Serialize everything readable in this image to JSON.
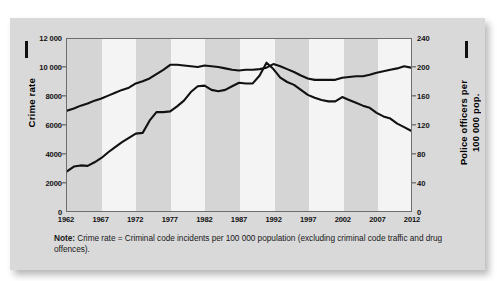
{
  "figure": {
    "note_label": "Note:",
    "note_text": "Crime rate = Criminal code incidents per 100 000 population (excluding criminal code traffic and drug offences)."
  },
  "chart_data": {
    "type": "line",
    "title": "",
    "subtitle": "",
    "xlabel": "",
    "ylabel": "Crime rate",
    "y2label": "Police officers per 100 000 pop.",
    "grid": false,
    "legend_position": "none",
    "xlim": [
      1962,
      2012
    ],
    "ylim": [
      0,
      12000
    ],
    "y2lim": [
      0,
      240
    ],
    "xticks": [
      1962,
      1967,
      1972,
      1977,
      1982,
      1987,
      1992,
      1997,
      2002,
      2007,
      2012
    ],
    "xticklabels": [
      "1962",
      "1967",
      "1972",
      "1977",
      "1982",
      "1987",
      "1992",
      "1997",
      "2002",
      "2007",
      "2012"
    ],
    "yticks": [
      0,
      2000,
      4000,
      6000,
      8000,
      10000,
      12000
    ],
    "yticklabels": [
      "0",
      "2000",
      "4000",
      "6000",
      "8000",
      "10 000",
      "12 000"
    ],
    "y2ticks": [
      0,
      40,
      80,
      120,
      160,
      200,
      240
    ],
    "y2ticklabels": [
      "0",
      "40",
      "80",
      "120",
      "160",
      "200",
      "240"
    ],
    "line_color": "#111111",
    "band_color_dark": "#d5d5d5",
    "band_color_light": "#f4f4f4",
    "x": [
      1962,
      1963,
      1964,
      1965,
      1966,
      1967,
      1968,
      1969,
      1970,
      1971,
      1972,
      1973,
      1974,
      1975,
      1976,
      1977,
      1978,
      1979,
      1980,
      1981,
      1982,
      1983,
      1984,
      1985,
      1986,
      1987,
      1988,
      1989,
      1990,
      1991,
      1992,
      1993,
      1994,
      1995,
      1996,
      1997,
      1998,
      1999,
      2000,
      2001,
      2002,
      2003,
      2004,
      2005,
      2006,
      2007,
      2008,
      2009,
      2010,
      2011,
      2012
    ],
    "series": [
      {
        "name": "Crime rate",
        "axis": "left",
        "values": [
          2771,
          3100,
          3180,
          3150,
          3400,
          3700,
          4100,
          4450,
          4800,
          5100,
          5400,
          5450,
          6300,
          6900,
          6900,
          6950,
          7300,
          7700,
          8300,
          8700,
          8750,
          8450,
          8350,
          8450,
          8700,
          8950,
          8900,
          8900,
          9450,
          10350,
          9900,
          9300,
          9000,
          8800,
          8450,
          8100,
          7900,
          7750,
          7650,
          7650,
          7950,
          7750,
          7550,
          7350,
          7200,
          6850,
          6600,
          6450,
          6100,
          5850,
          5600
        ]
      },
      {
        "name": "Police officers",
        "axis": "right",
        "values": [
          140,
          143,
          147,
          150,
          154,
          157,
          161,
          165,
          169,
          172,
          178,
          181,
          185,
          191,
          197,
          204,
          204,
          203,
          202,
          201,
          203,
          202,
          201,
          199,
          197,
          196,
          197,
          197,
          198,
          200,
          205,
          202,
          198,
          194,
          189,
          185,
          183,
          183,
          183,
          183,
          186,
          187,
          188,
          188,
          190,
          193,
          195,
          197,
          199,
          202,
          200
        ]
      }
    ]
  }
}
